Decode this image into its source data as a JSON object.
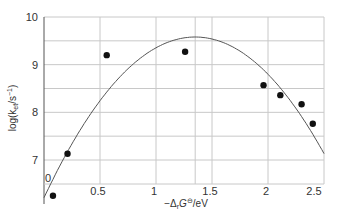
{
  "chart_data": {
    "type": "scatter",
    "title": "",
    "xlabel": "−Δ_r G^⊖/eV",
    "ylabel": "log(k_et/s⁻¹)",
    "xlim": [
      0,
      2.5
    ],
    "ylim": [
      6.5,
      10
    ],
    "y_axis_break_label": "0",
    "grid": true,
    "x_ticks": [
      0.5,
      1,
      1.5,
      2,
      2.5
    ],
    "x_tick_labels": [
      "0.5",
      "1",
      "1.5",
      "2",
      "2.5"
    ],
    "y_ticks": [
      7,
      8,
      9,
      10
    ],
    "y_tick_labels": [
      "7",
      "8",
      "9",
      "10"
    ],
    "extra_vertical_gridline_x": 1.35,
    "series": [
      {
        "name": "experimental points",
        "kind": "scatter",
        "x": [
          0.08,
          0.21,
          0.56,
          1.26,
          1.96,
          2.11,
          2.3,
          2.4
        ],
        "y": [
          6.25,
          7.13,
          9.2,
          9.27,
          8.57,
          8.36,
          8.17,
          7.76
        ]
      },
      {
        "name": "Marcus parabola fit",
        "kind": "line",
        "peak_x": 1.35,
        "peak_y": 9.58,
        "curvature": 1.85,
        "x": [
          0.0,
          0.25,
          0.5,
          0.75,
          1.0,
          1.25,
          1.35,
          1.5,
          1.75,
          2.0,
          2.25,
          2.5
        ],
        "y": [
          6.21,
          7.34,
          8.24,
          8.91,
          9.35,
          9.56,
          9.58,
          9.54,
          9.28,
          8.8,
          8.08,
          7.13
        ]
      }
    ],
    "legend": []
  },
  "labels": {
    "xlabel_prefix": "−Δ",
    "xlabel_sub": "r",
    "xlabel_main": "G",
    "xlabel_sup": "⊖",
    "xlabel_suffix": "/eV",
    "ylabel_prefix": "log(k",
    "ylabel_sub": "et",
    "ylabel_suffix": "/s",
    "ylabel_sup": "−1",
    "ylabel_close": ")"
  },
  "colors": {
    "grid": "#c8c8c8",
    "axis": "#555555",
    "curve": "#555555",
    "points": "#111111",
    "text": "#333333"
  }
}
